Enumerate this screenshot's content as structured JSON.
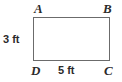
{
  "figure": {
    "type": "rectangle",
    "stroke_color": "#6b6b6b",
    "fill_color": "#ffffff",
    "text_color": "#2b2b2b",
    "vertices": [
      {
        "id": "a",
        "label": "A",
        "position": "top-left"
      },
      {
        "id": "b",
        "label": "B",
        "position": "top-right"
      },
      {
        "id": "c",
        "label": "C",
        "position": "bottom-right"
      },
      {
        "id": "d",
        "label": "D",
        "position": "bottom-left"
      }
    ],
    "dimensions": [
      {
        "id": "height",
        "label": "3 ft",
        "value": 3,
        "unit": "ft",
        "side": "left",
        "edge": "AD"
      },
      {
        "id": "width",
        "label": "5 ft",
        "value": 5,
        "unit": "ft",
        "side": "bottom",
        "edge": "DC"
      }
    ]
  }
}
